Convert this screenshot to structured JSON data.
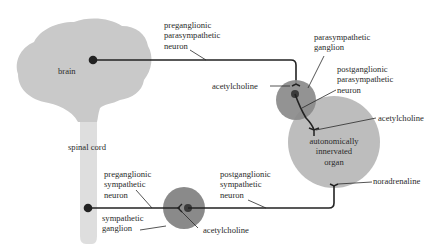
{
  "colors": {
    "brain": "#c9c9c9",
    "spinal_cord": "#dedede",
    "ganglion": "#8a8a8a",
    "organ": "#bdbdbd",
    "neuron_line": "#222222",
    "text": "#2a2a2a"
  },
  "structures": {
    "brain": "brain",
    "spinal_cord": "spinal cord",
    "parasympathetic_ganglion": [
      "parasympathetic",
      "ganglion"
    ],
    "sympathetic_ganglion": [
      "sympathetic",
      "ganglion"
    ],
    "organ": [
      "autonomically",
      "innervated",
      "organ"
    ]
  },
  "neurons": {
    "preganglionic_parasympathetic": [
      "preganglionic",
      "parasympathetic",
      "neuron"
    ],
    "postganglionic_parasympathetic": [
      "postganglionic",
      "parasympathetic",
      "neuron"
    ],
    "preganglionic_sympathetic": [
      "preganglionic",
      "sympathetic",
      "neuron"
    ],
    "postganglionic_sympathetic": [
      "postganglionic",
      "sympathetic",
      "neuron"
    ]
  },
  "neurotransmitters": {
    "para_ganglion": "acetylcholine",
    "para_organ": "acetylcholine",
    "symp_ganglion": "acetylcholine",
    "symp_organ": "noradrenaline"
  }
}
